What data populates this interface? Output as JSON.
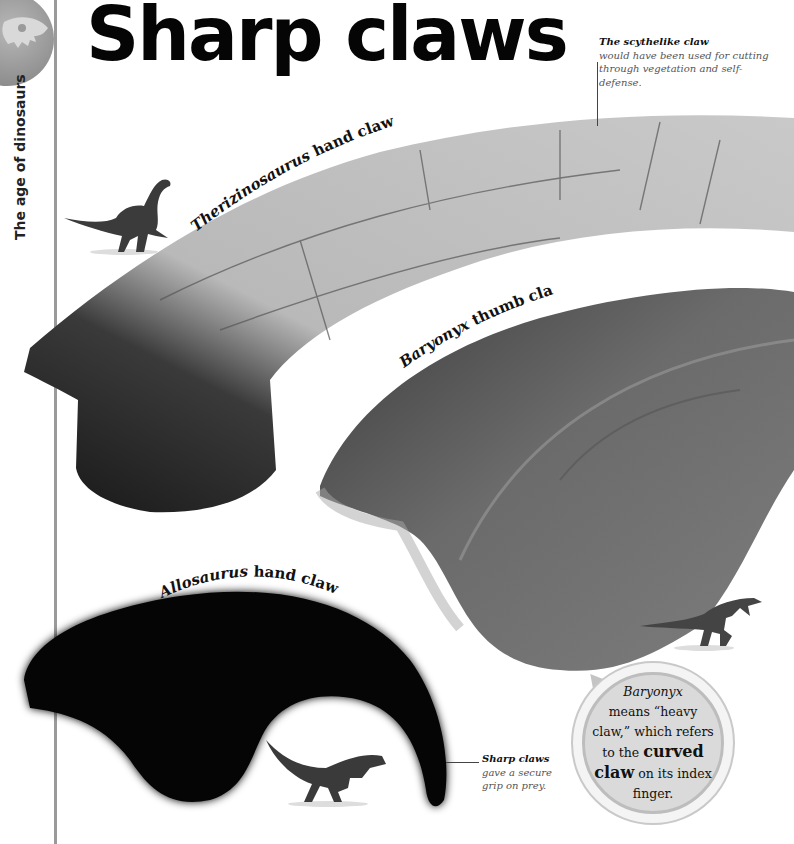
{
  "page": {
    "title": "Sharp claws",
    "section_label": "The age of dinosaurs",
    "section_icon": "dinosaur-skull-icon"
  },
  "claws": [
    {
      "id": "therizinosaurus",
      "label": "Therizinosaurus hand claw",
      "label_italic": "Therizinosaurus",
      "label_rest": " hand claw",
      "tone": "pale-fossil"
    },
    {
      "id": "baryonyx",
      "label": "Baryonyx thumb claw",
      "label_italic": "Baryonyx",
      "label_rest": " thumb claw",
      "tone": "dark-fossil"
    },
    {
      "id": "allosaurus",
      "label": "Allosaurus hand claw",
      "label_italic": "Allosaurus",
      "label_rest": " hand claw",
      "tone": "black-silhouette"
    }
  ],
  "annotations": {
    "scythe": {
      "lead": "The scythelike claw",
      "body": "would have been used for cutting through vegetation and self-defense."
    },
    "sharp": {
      "lead": "Sharp claws",
      "body": "gave a secure grip on prey."
    }
  },
  "fact_bubble": {
    "name": "Baryonyx",
    "line1": "means “heavy claw,” which refers to the",
    "emphasis": "curved claw",
    "line2": "on its index finger."
  },
  "figures": [
    {
      "id": "therizinosaurus-figure",
      "icon": "therizinosaurus-icon"
    },
    {
      "id": "baryonyx-figure",
      "icon": "baryonyx-icon"
    },
    {
      "id": "allosaurus-figure",
      "icon": "allosaurus-icon"
    }
  ],
  "colors": {
    "margin_rule": "#9a9a9a",
    "title": "#050505",
    "bubble_fill": "#dadada",
    "bubble_ring": "#bdbdbd"
  }
}
